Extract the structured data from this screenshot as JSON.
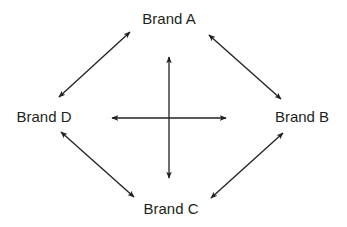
{
  "diagram": {
    "type": "perceptual-map",
    "nodes": [
      {
        "id": "brand-a",
        "label": "Brand A",
        "x": 169,
        "y": 18
      },
      {
        "id": "brand-b",
        "label": "Brand B",
        "x": 302,
        "y": 116
      },
      {
        "id": "brand-c",
        "label": "Brand C",
        "x": 171,
        "y": 208
      },
      {
        "id": "brand-d",
        "label": "Brand D",
        "x": 44,
        "y": 116
      }
    ],
    "edges": [
      {
        "from": "brand-d",
        "to": "brand-a",
        "x1": 59,
        "y1": 97,
        "x2": 130,
        "y2": 32,
        "bidirectional": true
      },
      {
        "from": "brand-a",
        "to": "brand-b",
        "x1": 209,
        "y1": 35,
        "x2": 281,
        "y2": 99,
        "bidirectional": true
      },
      {
        "from": "brand-d",
        "to": "brand-c",
        "x1": 61,
        "y1": 132,
        "x2": 134,
        "y2": 197,
        "bidirectional": true
      },
      {
        "from": "brand-c",
        "to": "brand-b",
        "x1": 211,
        "y1": 198,
        "x2": 283,
        "y2": 133,
        "bidirectional": true
      }
    ],
    "axes": [
      {
        "id": "vertical-axis",
        "x1": 169,
        "y1": 57,
        "x2": 169,
        "y2": 178,
        "bidirectional": true
      },
      {
        "id": "horizontal-axis",
        "x1": 112,
        "y1": 118,
        "x2": 226,
        "y2": 118,
        "bidirectional": true
      }
    ],
    "colors": {
      "line": "#231f20",
      "background": "#ffffff"
    }
  }
}
